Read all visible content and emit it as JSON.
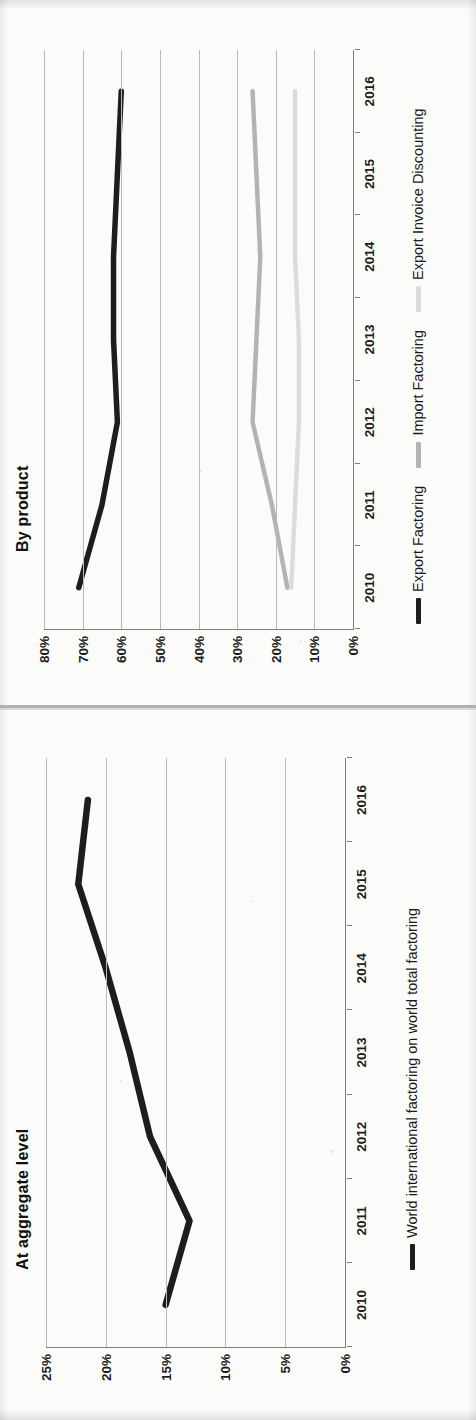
{
  "page": {
    "background": "#fbfbfa",
    "divider_color": "#9a9a9a"
  },
  "figures": [
    {
      "id": "by-product",
      "title": "By product"
    },
    {
      "id": "at-aggregate-level",
      "title": "At aggregate level"
    }
  ],
  "chart_data": [
    {
      "type": "line",
      "title": "By product",
      "xlabel": "",
      "ylabel": "",
      "x": [
        "2010",
        "2011",
        "2012",
        "2013",
        "2014",
        "2015",
        "2016"
      ],
      "categories": [
        "2010",
        "2011",
        "2012",
        "2013",
        "2014",
        "2015",
        "2016"
      ],
      "ytick_labels": [
        "80%",
        "70%",
        "60%",
        "50%",
        "40%",
        "30%",
        "20%",
        "10%",
        "0%"
      ],
      "ytick_values": [
        80,
        70,
        60,
        50,
        40,
        30,
        20,
        10,
        0
      ],
      "ylim": [
        0,
        80
      ],
      "grid": true,
      "grid_axis": "y",
      "legend_position": "bottom",
      "series": [
        {
          "name": "Export Factoring",
          "color": "#1d1d1d",
          "width": 5.5,
          "values": [
            71,
            65,
            61,
            62,
            62,
            61,
            60
          ]
        },
        {
          "name": "Import Factoring",
          "color": "#b3b3b3",
          "width": 4.5,
          "values": [
            17,
            21,
            26,
            25,
            24,
            25,
            26
          ]
        },
        {
          "name": "Export Invoice Discounting",
          "color": "#dcdcdc",
          "width": 4.5,
          "values": [
            16,
            15,
            14,
            14,
            15,
            15,
            15
          ]
        }
      ]
    },
    {
      "type": "line",
      "title": "At aggregate level",
      "xlabel": "",
      "ylabel": "",
      "x": [
        "2010",
        "2011",
        "2012",
        "2013",
        "2014",
        "2015",
        "2016"
      ],
      "categories": [
        "2010",
        "2011",
        "2012",
        "2013",
        "2014",
        "2015",
        "2016"
      ],
      "ytick_labels": [
        "25%",
        "20%",
        "15%",
        "10%",
        "5%",
        "0%"
      ],
      "ytick_values": [
        25,
        20,
        15,
        10,
        5,
        0
      ],
      "ylim": [
        0,
        25
      ],
      "grid": true,
      "grid_axis": "y",
      "legend_position": "bottom",
      "series": [
        {
          "name": "World international factoring on world total factoring",
          "color": "#1d1d1d",
          "width": 6.5,
          "values": [
            15.0,
            13.0,
            16.3,
            18.0,
            20.0,
            22.3,
            21.5
          ]
        }
      ]
    }
  ]
}
